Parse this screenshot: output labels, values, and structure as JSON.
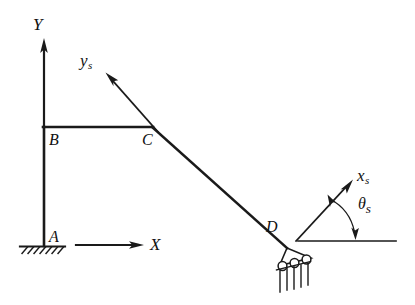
{
  "figure": {
    "background_color": "#ffffff",
    "line_color": "#1a1a1a",
    "width": 415,
    "height": 305,
    "labels": {
      "global_y_axis": "Y",
      "global_x_axis": "X",
      "node_a": "A",
      "node_b": "B",
      "node_c": "C",
      "node_d": "D",
      "local_y_axis": "y",
      "local_y_axis_sub": "s",
      "local_x_axis": "x",
      "local_x_axis_sub": "s",
      "angle": "θ",
      "angle_sub": "s"
    },
    "geometry": {
      "node_a": [
        44,
        246
      ],
      "node_b": [
        44,
        127
      ],
      "node_c": [
        152,
        127
      ],
      "node_d": [
        287,
        248
      ],
      "global_y_axis_from": [
        44,
        127
      ],
      "global_y_axis_to": [
        44,
        40
      ],
      "global_x_axis_from": [
        76,
        245
      ],
      "global_x_axis_to": [
        143,
        245
      ],
      "local_ys_from": [
        158,
        132
      ],
      "local_ys_to": [
        106,
        73
      ],
      "local_xs_from": [
        296,
        241
      ],
      "local_xs_to": [
        352,
        180
      ],
      "reference_line_from": [
        298,
        241
      ],
      "reference_line_to": [
        396,
        241
      ]
    },
    "supports": {
      "a_type": "fixed-ground-hatched",
      "a_hatch_count": 7,
      "d_type": "inclined-roller",
      "d_roller_count": 3,
      "d_hatch_count": 5
    }
  }
}
